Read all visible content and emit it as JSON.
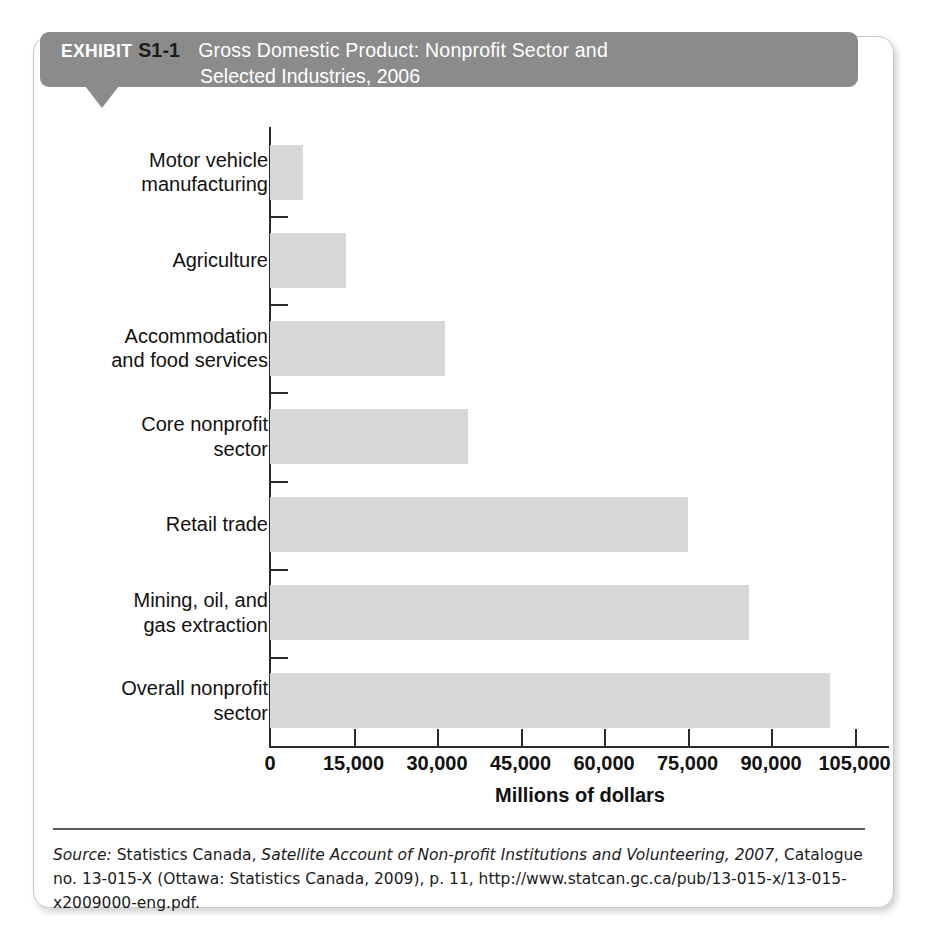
{
  "exhibit": {
    "label": "EXHIBIT",
    "number": "S1-1",
    "title_line1": "Gross Domestic Product: Nonprofit Sector and",
    "title_line2": "Selected Industries, 2006",
    "header_bg": "#8b8b8b",
    "panel_border": "#c9c9c9"
  },
  "chart_data": {
    "type": "bar",
    "orientation": "horizontal",
    "title": "Gross Domestic Product: Nonprofit Sector and Selected Industries, 2006",
    "xlabel": "Millions of dollars",
    "ylabel": "",
    "xlim": [
      0,
      111000
    ],
    "xticks": [
      0,
      15000,
      30000,
      45000,
      60000,
      75000,
      90000,
      105000
    ],
    "xtick_labels": [
      "0",
      "15,000",
      "30,000",
      "45,000",
      "60,000",
      "75,000",
      "90,000",
      "105,000"
    ],
    "grid": false,
    "legend": false,
    "bar_color": "#d6d7d9",
    "categories": [
      "Motor vehicle manufacturing",
      "Agriculture",
      "Accommodation and food services",
      "Core nonprofit sector",
      "Retail trade",
      "Mining, oil, and gas extraction",
      "Overall nonprofit sector"
    ],
    "category_lines": [
      [
        "Motor vehicle",
        "manufacturing"
      ],
      [
        "Agriculture"
      ],
      [
        "Accommodation",
        "and food services"
      ],
      [
        "Core nonprofit",
        "sector"
      ],
      [
        "Retail trade"
      ],
      [
        "Mining, oil, and",
        "gas extraction"
      ],
      [
        "Overall nonprofit",
        "sector"
      ]
    ],
    "values": [
      5900,
      13600,
      31500,
      35500,
      75000,
      86000,
      100500
    ]
  },
  "source": {
    "prefix": "Source:",
    "text_before_title": " Statistics Canada, ",
    "italic_title": "Satellite Account of Non-profit Institutions and Volunteering, 2007",
    "text_after_title": ", Catalogue no. 13-015-X (Ottawa: Statistics Canada, 2009), p. 11, http://www.statcan.gc.ca/pub/13-015-x/13-015-x2009000-eng.pdf."
  }
}
